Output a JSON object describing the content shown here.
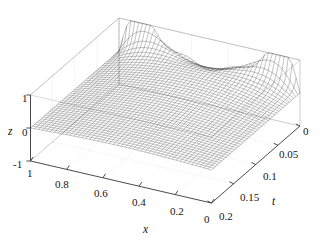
{
  "figure": {
    "background_color": "#ffffff",
    "width": 320,
    "height": 247
  },
  "chart_data": {
    "type": "surface",
    "title": "",
    "xlabel": "x",
    "ylabel": "t",
    "zlabel": "z",
    "xlim": [
      0,
      1
    ],
    "ylim": [
      0,
      0.2
    ],
    "zlim": [
      -1,
      1
    ],
    "x_ticks": [
      1,
      0.8,
      0.6,
      0.4,
      0.2,
      0
    ],
    "x_tick_labels": [
      "1",
      "0.8",
      "0.6",
      "0.4",
      "0.2",
      "0"
    ],
    "t_ticks": [
      0.2,
      0.15,
      0.1,
      0.05,
      0
    ],
    "t_tick_labels": [
      "0.2",
      "0.15",
      "0.1",
      "0.05",
      "0"
    ],
    "z_ticks": [
      1,
      0,
      -1
    ],
    "z_tick_labels": [
      "1",
      "0",
      "-1"
    ],
    "grid": true,
    "legend": null,
    "mesh_color": "#2a2a2a",
    "box_color": "#9a9a9a",
    "grid_color": "#c8c8c8",
    "surface_description": "Wireframe mesh surface z(x,t) decaying in t, oscillating in x; ridge near x~0.75 at t=0 and valley near x~0.25",
    "mesh_nx": 46,
    "mesh_nt": 42,
    "samples": {
      "x": [
        0,
        0.1,
        0.2,
        0.3,
        0.4,
        0.5,
        0.6,
        0.7,
        0.8,
        0.9,
        1
      ],
      "t": [
        0,
        0.05,
        0.1,
        0.15,
        0.2
      ],
      "z_rows": [
        [
          0.0,
          0.0,
          0.0,
          0.0,
          0.0
        ],
        [
          0.62,
          0.44,
          0.31,
          0.22,
          0.15
        ],
        [
          0.96,
          0.7,
          0.5,
          0.36,
          0.25
        ],
        [
          0.99,
          0.85,
          0.64,
          0.47,
          0.34
        ],
        [
          0.78,
          0.88,
          0.72,
          0.55,
          0.4
        ],
        [
          0.41,
          0.82,
          0.74,
          0.59,
          0.44
        ],
        [
          0.06,
          0.68,
          0.7,
          0.58,
          0.45
        ],
        [
          -0.22,
          0.49,
          0.6,
          0.53,
          0.42
        ],
        [
          -0.42,
          0.28,
          0.45,
          0.43,
          0.35
        ],
        [
          -0.38,
          0.11,
          0.26,
          0.27,
          0.23
        ],
        [
          0.0,
          0.0,
          0.0,
          0.0,
          0.0
        ]
      ]
    }
  },
  "axes": {
    "x_axis_name": "x",
    "t_axis_name": "t",
    "z_axis_name": "z"
  },
  "ticks": {
    "x": [
      {
        "label": "1",
        "left": 27,
        "top": 168
      },
      {
        "label": "0.8",
        "left": 57,
        "top": 179
      },
      {
        "label": "0.6",
        "left": 96,
        "top": 189
      },
      {
        "label": "0.4",
        "left": 134,
        "top": 198
      },
      {
        "label": "0.2",
        "left": 172,
        "top": 206
      },
      {
        "label": "0",
        "left": 205,
        "top": 214
      }
    ],
    "t": [
      {
        "label": "0.2",
        "top": 211,
        "left": 219
      },
      {
        "label": "0.15",
        "top": 192,
        "left": 241
      },
      {
        "label": "0.1",
        "top": 172,
        "left": 263
      },
      {
        "label": "0.05",
        "top": 150,
        "left": 280
      },
      {
        "label": "0",
        "top": 126,
        "left": 303
      }
    ],
    "z": [
      {
        "label": "1",
        "left": 22,
        "top": 93
      },
      {
        "label": "0",
        "left": 22,
        "top": 127
      },
      {
        "label": "-1",
        "left": 14,
        "top": 159
      }
    ]
  },
  "labels": {
    "x_name_pos": {
      "left": 143,
      "top": 225
    },
    "t_name_pos": {
      "left": 272,
      "top": 197
    },
    "z_name_pos": {
      "left": 8,
      "top": 126
    }
  }
}
